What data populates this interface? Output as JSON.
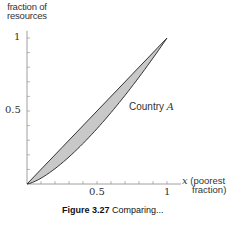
{
  "chart_data": {
    "type": "area",
    "title": "",
    "xlabel": "x (poorest fraction)",
    "ylabel": "fraction of resources",
    "xlim": [
      0,
      1
    ],
    "ylim": [
      0,
      1
    ],
    "x_ticks": [
      0.5,
      1
    ],
    "y_ticks": [
      0.5,
      1
    ],
    "minor_tick_step": 0.1,
    "grid": false,
    "series": [
      {
        "name": "Line of equality",
        "x": [
          0,
          0.25,
          0.5,
          0.75,
          1
        ],
        "values": [
          0,
          0.25,
          0.5,
          0.75,
          1
        ]
      },
      {
        "name": "Country A (Lorenz curve)",
        "x": [
          0,
          0.1,
          0.2,
          0.3,
          0.4,
          0.5,
          0.6,
          0.7,
          0.8,
          0.9,
          1
        ],
        "values": [
          0,
          0.04,
          0.105,
          0.185,
          0.277,
          0.379,
          0.489,
          0.607,
          0.732,
          0.863,
          1
        ]
      }
    ],
    "annotations": [
      "Country A"
    ],
    "fill_between": {
      "color": "#c8c8c8",
      "between": [
        "Line of equality",
        "Country A (Lorenz curve)"
      ]
    }
  },
  "labels": {
    "ylabel_line1": "fraction of",
    "ylabel_line2": "resources",
    "y_tick_1": "1",
    "y_tick_05": "0.5",
    "x_tick_05": "0.5",
    "x_tick_1": "1",
    "x_var": "x",
    "xlabel_line1": "(poorest",
    "xlabel_line2": "fraction)",
    "series_name": "Country",
    "series_var": "A",
    "caption_bold": "Figure 3.27",
    "caption_rest": "Comparing..."
  },
  "colors": {
    "fill": "#c8c8c8",
    "line": "#333333",
    "axis": "#888888"
  }
}
